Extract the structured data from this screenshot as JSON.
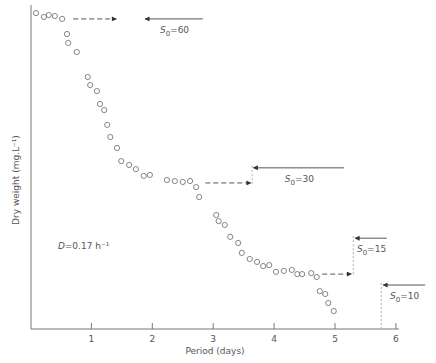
{
  "chart_data": {
    "type": "scatter",
    "title": "",
    "xlabel": "Period (days)",
    "ylabel": "Dry weight (mg.L⁻¹)",
    "xlim": [
      0,
      6
    ],
    "ylim": [
      0,
      100
    ],
    "y_scale_note": "no numeric y ticks shown; y values are relative (0 = axis, 100 = top)",
    "x_ticks": [
      "1",
      "2",
      "3",
      "4",
      "5",
      "6"
    ],
    "x_tick_values": [
      1,
      2,
      3,
      4,
      5,
      6
    ],
    "grid": false,
    "legend": "none",
    "series": [
      {
        "name": "Dry weight",
        "marker": "open-circle",
        "points": [
          [
            0.09,
            98.4
          ],
          [
            0.22,
            97.2
          ],
          [
            0.3,
            97.8
          ],
          [
            0.4,
            97.5
          ],
          [
            0.52,
            96.6
          ],
          [
            0.6,
            91.9
          ],
          [
            0.62,
            89.1
          ],
          [
            0.76,
            86.3
          ],
          [
            0.94,
            78.5
          ],
          [
            0.98,
            76.0
          ],
          [
            1.09,
            74.1
          ],
          [
            1.14,
            70.1
          ],
          [
            1.21,
            68.2
          ],
          [
            1.26,
            63.6
          ],
          [
            1.31,
            59.8
          ],
          [
            1.42,
            56.4
          ],
          [
            1.49,
            52.3
          ],
          [
            1.62,
            51.1
          ],
          [
            1.73,
            49.8
          ],
          [
            1.86,
            47.7
          ],
          [
            1.96,
            48.0
          ],
          [
            2.24,
            46.4
          ],
          [
            2.37,
            46.1
          ],
          [
            2.5,
            45.8
          ],
          [
            2.62,
            46.1
          ],
          [
            2.72,
            44.2
          ],
          [
            2.77,
            41.1
          ],
          [
            3.05,
            35.5
          ],
          [
            3.09,
            33.6
          ],
          [
            3.19,
            32.4
          ],
          [
            3.28,
            28.7
          ],
          [
            3.41,
            26.8
          ],
          [
            3.47,
            23.7
          ],
          [
            3.6,
            21.8
          ],
          [
            3.72,
            20.9
          ],
          [
            3.82,
            19.6
          ],
          [
            3.92,
            19.9
          ],
          [
            4.03,
            17.8
          ],
          [
            4.16,
            18.1
          ],
          [
            4.29,
            18.4
          ],
          [
            4.38,
            17.1
          ],
          [
            4.46,
            17.1
          ],
          [
            4.61,
            17.4
          ],
          [
            4.7,
            16.2
          ],
          [
            4.75,
            11.8
          ],
          [
            4.84,
            10.9
          ],
          [
            4.89,
            8.1
          ],
          [
            4.98,
            5.6
          ]
        ]
      }
    ],
    "annotations": [
      {
        "text_var": "D",
        "text_rest": "=0.17 h⁻¹",
        "x": 0.45,
        "y": 25
      },
      {
        "label_var": "S",
        "label_sub": "0",
        "label_rest": "=60",
        "arrow_from_x": 2.83,
        "arrow_to_x": 1.88,
        "y": 96.6,
        "dashed_from_x": 0.7,
        "dashed_to_x": 1.41
      },
      {
        "label_var": "S",
        "label_sub": "0",
        "label_rest": "=30",
        "arrow_from_x": 5.15,
        "arrow_to_x": 3.66,
        "y": 50.2,
        "dashed_from_x": 2.87,
        "dashed_to_x": 3.62,
        "dashed_y": 45.5,
        "switch_x": 3.64
      },
      {
        "label_var": "S",
        "label_sub": "0",
        "label_rest": "=15",
        "arrow_from_x": 5.85,
        "arrow_to_x": 5.33,
        "y": 28.3,
        "dashed_from_x": 4.79,
        "dashed_to_x": 5.27,
        "dashed_y": 17.1,
        "switch_x": 5.3
      },
      {
        "label_var": "S",
        "label_sub": "0",
        "label_rest": "=10",
        "arrow_from_x": 6.48,
        "arrow_to_x": 5.79,
        "y": 13.7,
        "switch_x": 5.76
      }
    ]
  }
}
